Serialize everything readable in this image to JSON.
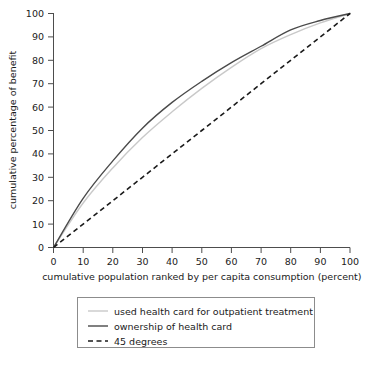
{
  "chart_data": {
    "type": "line",
    "title": "",
    "xlabel": "cumulative population ranked by per capita consumption (percent)",
    "ylabel": "cumulative percentage of benefit",
    "xlim": [
      0,
      100
    ],
    "ylim": [
      0,
      100
    ],
    "grid": false,
    "legend_position": "bottom",
    "xticks": [
      "0",
      "10",
      "20",
      "30",
      "40",
      "50",
      "60",
      "70",
      "80",
      "90",
      "100"
    ],
    "yticks": [
      "0",
      "10",
      "20",
      "30",
      "40",
      "50",
      "60",
      "70",
      "80",
      "90",
      "100"
    ],
    "x": [
      0,
      10,
      20,
      30,
      40,
      50,
      60,
      70,
      80,
      90,
      100
    ],
    "series": [
      {
        "name": "used health card for outpatient treatment",
        "color": "#c9c9c9",
        "style": "solid",
        "values": [
          0,
          19,
          34,
          47,
          58,
          68,
          77,
          85,
          91,
          96,
          100
        ]
      },
      {
        "name": "ownership of health card",
        "color": "#4a4a4a",
        "style": "solid",
        "values": [
          0,
          21,
          37,
          51,
          62,
          71,
          79,
          86,
          93,
          97,
          100
        ]
      },
      {
        "name": "45 degrees",
        "color": "#1a1a1a",
        "style": "dashed",
        "values": [
          0,
          10,
          20,
          30,
          40,
          50,
          60,
          70,
          80,
          90,
          100
        ]
      }
    ]
  },
  "legend": {
    "entries": [
      {
        "label": "used health card for outpatient treatment"
      },
      {
        "label": "ownership of health card"
      },
      {
        "label": "45 degrees"
      }
    ]
  }
}
